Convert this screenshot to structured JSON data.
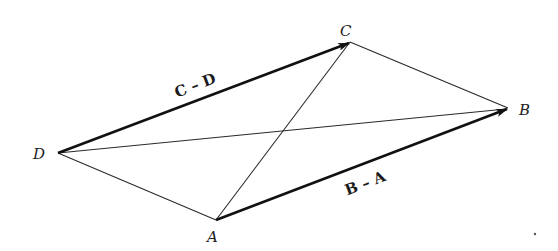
{
  "diagram": {
    "type": "geometry-vector-quadrilateral",
    "vertices": {
      "A": {
        "label": "A",
        "x": 216,
        "y": 220
      },
      "B": {
        "label": "B",
        "x": 508,
        "y": 108
      },
      "C": {
        "label": "C",
        "x": 350,
        "y": 42
      },
      "D": {
        "label": "D",
        "x": 58,
        "y": 153
      }
    },
    "vectors": [
      {
        "from": "D",
        "to": "C",
        "label": "C – D"
      },
      {
        "from": "A",
        "to": "B",
        "label": "B – A"
      }
    ],
    "segments": [
      {
        "from": "C",
        "to": "B"
      },
      {
        "from": "D",
        "to": "A"
      },
      {
        "from": "D",
        "to": "B"
      },
      {
        "from": "A",
        "to": "C"
      }
    ],
    "colors": {
      "ink": "#111111",
      "background": "#ffffff"
    }
  }
}
